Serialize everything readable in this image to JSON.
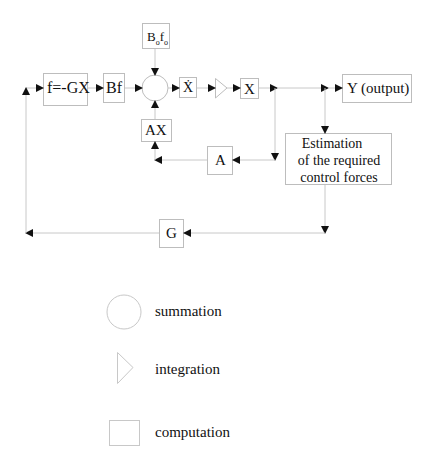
{
  "diagram": {
    "blocks": {
      "feedback_law": "f=-GX",
      "input_matrix": "Bf",
      "external_input": "B",
      "external_input_sub": "o",
      "external_input_f": "f",
      "external_input_f_sub": "o",
      "state_derivative": "Ẋ",
      "state": "X",
      "output": "Y (output)",
      "system_term": "AX",
      "system_matrix": "A",
      "estimation_line1": "Estimation",
      "estimation_line2": "of the required",
      "estimation_line3": "control forces",
      "gain": "G"
    },
    "legend": [
      {
        "shape": "circle",
        "label": "summation"
      },
      {
        "shape": "triangle",
        "label": "integration"
      },
      {
        "shape": "square",
        "label": "computation"
      }
    ],
    "colors": {
      "line": "#c8c8c8",
      "box_border": "#bdbdbd",
      "arrow": "#111111",
      "text": "#111111"
    }
  }
}
